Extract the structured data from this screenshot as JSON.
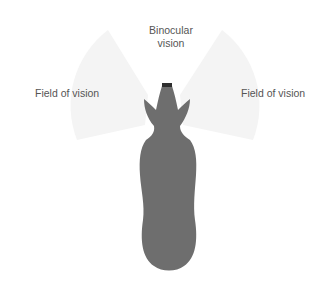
{
  "diagram": {
    "labels": {
      "binocular_line1": "Binocular",
      "binocular_line2": "vision",
      "left_field": "Field of vision",
      "right_field": "Field of vision"
    },
    "colors": {
      "background": "#ffffff",
      "field_fill": "#f4f4f4",
      "horse_fill": "#6e6e6e",
      "muzzle_fill": "#2e2e2e",
      "label_text": "#555555"
    }
  }
}
